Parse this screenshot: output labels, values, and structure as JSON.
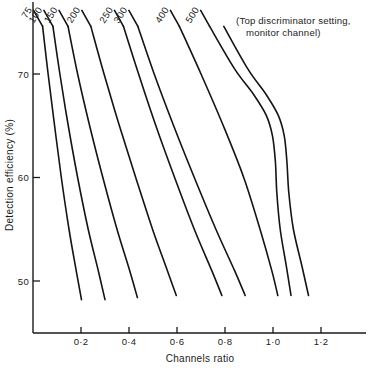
{
  "chart_data": {
    "type": "line",
    "title": "",
    "xlabel": "Channels ratio",
    "ylabel": "Detection efficiency (%)",
    "xlim": [
      0.0,
      1.34
    ],
    "ylim": [
      47.0,
      75.2
    ],
    "grid": false,
    "legend_position": "inline-curve-labels",
    "xticks": [
      0.2,
      0.4,
      0.6,
      0.8,
      1.0,
      1.2
    ],
    "xticklabels": [
      "0·2",
      "0·4",
      "0·6",
      "0·8",
      "1·0",
      "1·2"
    ],
    "yticks": [
      50,
      60,
      70
    ],
    "yticklabels": [
      "50",
      "60",
      "70"
    ],
    "annotation": {
      "line1": "(Top discriminator setting,",
      "line2": "monitor channel)"
    },
    "series": [
      {
        "name": "75",
        "label": "75",
        "points": [
          {
            "x": 0.04,
            "y": 74.6
          },
          {
            "x": 0.063,
            "y": 70.0
          },
          {
            "x": 0.09,
            "y": 65.0
          },
          {
            "x": 0.118,
            "y": 60.0
          },
          {
            "x": 0.15,
            "y": 55.0
          },
          {
            "x": 0.18,
            "y": 51.0
          },
          {
            "x": 0.202,
            "y": 48.2
          }
        ]
      },
      {
        "name": "100",
        "label": "100",
        "points": [
          {
            "x": 0.083,
            "y": 74.6
          },
          {
            "x": 0.112,
            "y": 70.0
          },
          {
            "x": 0.147,
            "y": 65.0
          },
          {
            "x": 0.186,
            "y": 60.0
          },
          {
            "x": 0.23,
            "y": 55.0
          },
          {
            "x": 0.272,
            "y": 51.0
          },
          {
            "x": 0.3,
            "y": 48.2
          }
        ]
      },
      {
        "name": "150",
        "label": "150",
        "points": [
          {
            "x": 0.146,
            "y": 74.6
          },
          {
            "x": 0.186,
            "y": 70.0
          },
          {
            "x": 0.236,
            "y": 65.0
          },
          {
            "x": 0.291,
            "y": 60.0
          },
          {
            "x": 0.35,
            "y": 55.0
          },
          {
            "x": 0.403,
            "y": 51.0
          },
          {
            "x": 0.435,
            "y": 48.4
          }
        ]
      },
      {
        "name": "200",
        "label": "200",
        "points": [
          {
            "x": 0.241,
            "y": 74.6
          },
          {
            "x": 0.296,
            "y": 70.0
          },
          {
            "x": 0.36,
            "y": 65.0
          },
          {
            "x": 0.428,
            "y": 60.0
          },
          {
            "x": 0.498,
            "y": 55.0
          },
          {
            "x": 0.56,
            "y": 51.0
          },
          {
            "x": 0.597,
            "y": 48.6
          }
        ]
      },
      {
        "name": "250",
        "label": "250",
        "points": [
          {
            "x": 0.377,
            "y": 74.6
          },
          {
            "x": 0.44,
            "y": 70.0
          },
          {
            "x": 0.512,
            "y": 65.0
          },
          {
            "x": 0.59,
            "y": 60.0
          },
          {
            "x": 0.672,
            "y": 55.0
          },
          {
            "x": 0.745,
            "y": 51.0
          },
          {
            "x": 0.787,
            "y": 48.6
          }
        ]
      },
      {
        "name": "300",
        "label": "300",
        "points": [
          {
            "x": 0.437,
            "y": 74.6
          },
          {
            "x": 0.505,
            "y": 70.0
          },
          {
            "x": 0.586,
            "y": 65.0
          },
          {
            "x": 0.672,
            "y": 60.0
          },
          {
            "x": 0.762,
            "y": 55.0
          },
          {
            "x": 0.84,
            "y": 51.0
          },
          {
            "x": 0.884,
            "y": 48.6
          }
        ]
      },
      {
        "name": "400",
        "label": "400",
        "points": [
          {
            "x": 0.61,
            "y": 74.6
          },
          {
            "x": 0.7,
            "y": 70.0
          },
          {
            "x": 0.793,
            "y": 65.0
          },
          {
            "x": 0.878,
            "y": 60.0
          },
          {
            "x": 0.946,
            "y": 55.0
          },
          {
            "x": 0.995,
            "y": 51.0
          },
          {
            "x": 1.02,
            "y": 48.6
          }
        ]
      },
      {
        "name": "500",
        "label": "500",
        "points": [
          {
            "x": 0.736,
            "y": 74.6
          },
          {
            "x": 0.84,
            "y": 70.5
          },
          {
            "x": 0.92,
            "y": 68.0
          },
          {
            "x": 0.972,
            "y": 66.0
          },
          {
            "x": 0.998,
            "y": 64.0
          },
          {
            "x": 1.01,
            "y": 61.5
          },
          {
            "x": 1.016,
            "y": 58.5
          },
          {
            "x": 1.03,
            "y": 55.0
          },
          {
            "x": 1.055,
            "y": 51.5
          },
          {
            "x": 1.075,
            "y": 48.6
          }
        ]
      },
      {
        "name": "500-upper-branch",
        "label": "",
        "points": [
          {
            "x": 0.795,
            "y": 74.6
          },
          {
            "x": 0.895,
            "y": 70.5
          },
          {
            "x": 0.972,
            "y": 68.0
          },
          {
            "x": 1.022,
            "y": 66.0
          },
          {
            "x": 1.047,
            "y": 64.0
          },
          {
            "x": 1.058,
            "y": 61.5
          },
          {
            "x": 1.066,
            "y": 58.5
          },
          {
            "x": 1.085,
            "y": 55.0
          },
          {
            "x": 1.12,
            "y": 51.5
          },
          {
            "x": 1.148,
            "y": 48.6
          }
        ]
      }
    ]
  }
}
